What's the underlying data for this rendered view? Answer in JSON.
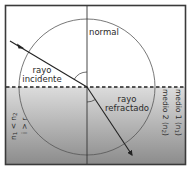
{
  "diagram": {
    "labels": {
      "normal": "normal",
      "incident_ray_line1": "rayo",
      "incident_ray_line2": "incidente",
      "refracted_ray_line1": "rayo",
      "refracted_ray_line2": "refractado",
      "medium1": "medio 1 (n",
      "medium1_sub": "1",
      "medium1_close": ")",
      "medium2": "medio 2 (n",
      "medium2_sub": "2",
      "medium2_close": ")",
      "index_relation": "n",
      "index_relation_sub1": "1",
      "index_relation_mid": " < n",
      "index_relation_sub2": "2",
      "angle_relation": "i > r"
    },
    "colors": {
      "frame": "#3a3a3a",
      "line": "#2a2a2a",
      "upper_medium": "#ffffff",
      "lower_medium_top": "#d9d9d9",
      "lower_medium_bottom": "#8f8f8f",
      "circle": "#555555"
    },
    "geometry": {
      "center": [
        87,
        87
      ],
      "circle_radius": 68,
      "incident_ray": {
        "from": [
          10,
          41
        ],
        "to": [
          87,
          87
        ]
      },
      "refracted_ray": {
        "from": [
          87,
          87
        ],
        "to": [
          133,
          157
        ]
      }
    }
  }
}
